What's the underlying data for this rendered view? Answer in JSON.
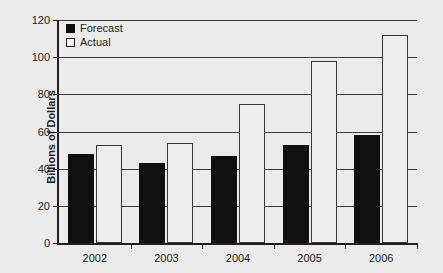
{
  "chart_data": {
    "type": "bar",
    "title": "",
    "xlabel": "",
    "ylabel": "Billions of Dollars",
    "categories": [
      "2002",
      "2003",
      "2004",
      "2005",
      "2006"
    ],
    "series": [
      {
        "name": "Forecast",
        "values": [
          48,
          43,
          47,
          53,
          58
        ],
        "color": "#111010"
      },
      {
        "name": "Actual",
        "values": [
          53,
          54,
          75,
          98,
          112
        ],
        "color": "#ededed"
      }
    ],
    "ylim": [
      0,
      120
    ],
    "yticks": [
      0,
      20,
      40,
      60,
      80,
      100,
      120
    ],
    "ytick_labels": [
      "0",
      "20",
      "40",
      "60",
      "80",
      "100",
      "120"
    ],
    "grid": true,
    "legend_position": "top-left",
    "background_color": "#ebebeb",
    "axis_color": "#231f20"
  },
  "legend": {
    "items": [
      {
        "label": "Forecast",
        "swatch": "filled-square-icon"
      },
      {
        "label": "Actual",
        "swatch": "outlined-square-icon"
      }
    ]
  }
}
